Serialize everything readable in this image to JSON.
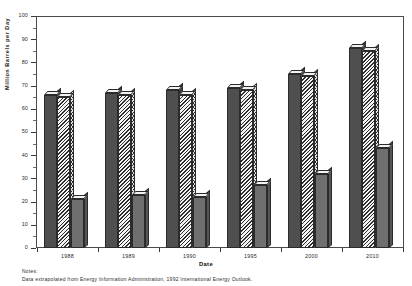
{
  "chart_data": {
    "type": "bar",
    "title": "",
    "xlabel": "Date",
    "ylabel": "Million Barrels per Day",
    "categories": [
      "1988",
      "1989",
      "1990",
      "1995",
      "2000",
      "2010"
    ],
    "ylim": [
      0,
      100
    ],
    "ytick_step": 10,
    "yticks": [
      "0",
      "10",
      "20",
      "30",
      "40",
      "50",
      "60",
      "70",
      "80",
      "90",
      "100"
    ],
    "grid": false,
    "legend": "none",
    "style": "3d-bars",
    "series": [
      {
        "name": "series-1",
        "fill": "solid-dark",
        "values": [
          66,
          67,
          68,
          69,
          75,
          86
        ]
      },
      {
        "name": "series-2",
        "fill": "diagonal-hatch",
        "values": [
          65,
          66,
          66,
          68,
          74,
          85
        ]
      },
      {
        "name": "series-3",
        "fill": "solid-mid",
        "values": [
          21,
          23,
          22,
          27,
          32,
          43
        ]
      }
    ],
    "notes_heading": "Notes:",
    "notes_text": "Data extrapolated from Energy Information Administration, 1992 International Energy Outlook."
  },
  "colors": {
    "series_1": "#4f4f4f",
    "series_2": "#2e2e2e",
    "series_3": "#6f6f6f",
    "axis": "#3a3a3a",
    "background": "#ffffff"
  }
}
